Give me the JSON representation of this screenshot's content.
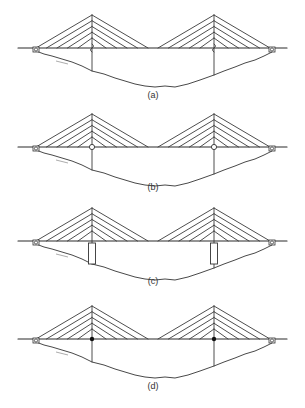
{
  "figure": {
    "panels": [
      {
        "label": "(a)",
        "connection": "sliding",
        "description": "Towers pass through deck with sliding joint"
      },
      {
        "label": "(b)",
        "connection": "pinned",
        "description": "Deck pinned to towers (open circle hinge)"
      },
      {
        "label": "(c)",
        "connection": "pier-supported",
        "description": "Deck resting on rectangular piers"
      },
      {
        "label": "(d)",
        "connection": "rigid",
        "description": "Deck rigidly fixed to towers (solid dot)"
      }
    ],
    "cables_per_side": 5,
    "towers": 2,
    "end_supports": "roller"
  }
}
